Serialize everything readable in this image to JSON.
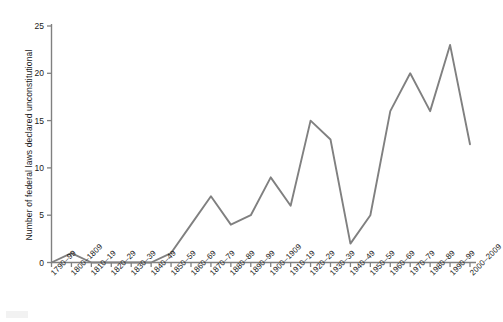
{
  "chart_data": {
    "type": "line",
    "title": "",
    "subtitle": "",
    "xlabel": "",
    "ylabel": "Number of federal laws declared unconstitutional",
    "ylim": [
      0,
      25
    ],
    "yticks": [
      0,
      5,
      10,
      15,
      20,
      25
    ],
    "grid": false,
    "legend": null,
    "line_color": "#808080",
    "axis_color": "#808080",
    "text_color": "#1a1a1a",
    "categories": [
      "1790–99",
      "1800–1809",
      "1810–19",
      "1820–29",
      "1830–39",
      "1840–49",
      "1850–59",
      "1860–69",
      "1870–79",
      "1880–89",
      "1890–99",
      "1900–1909",
      "1910–19",
      "1920–29",
      "1930–39",
      "1940–49",
      "1950–59",
      "1960–69",
      "1970–79",
      "1980–89",
      "1990–99",
      "2000–2009"
    ],
    "values": [
      0,
      1,
      0,
      0,
      0,
      0,
      1,
      4,
      7,
      4,
      5,
      9,
      6,
      15,
      13,
      2,
      5,
      16,
      20,
      16,
      23,
      12.5
    ]
  }
}
